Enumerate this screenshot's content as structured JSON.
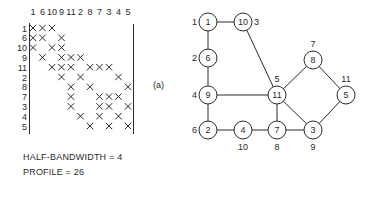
{
  "matrix": {
    "order": [
      "1",
      "6",
      "10",
      "9",
      "11",
      "2",
      "8",
      "7",
      "3",
      "4",
      "5"
    ],
    "rows": [
      {
        "label": "1",
        "cols": [
          0,
          1,
          2
        ]
      },
      {
        "label": "6",
        "cols": [
          0,
          1,
          3
        ]
      },
      {
        "label": "10",
        "cols": [
          0,
          2,
          3
        ]
      },
      {
        "label": "9",
        "cols": [
          1,
          3,
          4,
          5
        ]
      },
      {
        "label": "11",
        "cols": [
          2,
          3,
          4,
          6,
          7,
          8
        ]
      },
      {
        "label": "2",
        "cols": [
          3,
          5,
          9
        ]
      },
      {
        "label": "8",
        "cols": [
          4,
          6,
          10
        ]
      },
      {
        "label": "7",
        "cols": [
          4,
          7,
          8,
          9
        ]
      },
      {
        "label": "3",
        "cols": [
          4,
          7,
          8,
          10
        ]
      },
      {
        "label": "4",
        "cols": [
          5,
          7,
          9
        ]
      },
      {
        "label": "5",
        "cols": [
          6,
          8,
          10
        ]
      }
    ],
    "mark": "X"
  },
  "stats": {
    "half_bandwidth": "HALF-BANDWIDTH = 4",
    "profile": "PROFILE = 26"
  },
  "graph": {
    "panel_label": "(a)",
    "nodes": [
      {
        "id": "1",
        "x": 208,
        "y": 22,
        "order_label": "1",
        "label_pos": "left"
      },
      {
        "id": "10",
        "x": 243,
        "y": 22,
        "order_label": "3",
        "label_pos": "right"
      },
      {
        "id": "6",
        "x": 208,
        "y": 58,
        "order_label": "2",
        "label_pos": "left"
      },
      {
        "id": "9",
        "x": 208,
        "y": 95,
        "order_label": "4",
        "label_pos": "left"
      },
      {
        "id": "11",
        "x": 277,
        "y": 95,
        "order_label": "5",
        "label_pos": "top"
      },
      {
        "id": "8",
        "x": 313,
        "y": 60,
        "order_label": "7",
        "label_pos": "top"
      },
      {
        "id": "5",
        "x": 346,
        "y": 95,
        "order_label": "11",
        "label_pos": "top"
      },
      {
        "id": "2",
        "x": 208,
        "y": 130,
        "order_label": "6",
        "label_pos": "left"
      },
      {
        "id": "4",
        "x": 243,
        "y": 130,
        "order_label": "10",
        "label_pos": "bottom"
      },
      {
        "id": "7",
        "x": 277,
        "y": 130,
        "order_label": "8",
        "label_pos": "bottom"
      },
      {
        "id": "3",
        "x": 313,
        "y": 130,
        "order_label": "9",
        "label_pos": "bottom"
      }
    ],
    "edges": [
      [
        "1",
        "10"
      ],
      [
        "1",
        "6"
      ],
      [
        "6",
        "9"
      ],
      [
        "10",
        "11"
      ],
      [
        "9",
        "11"
      ],
      [
        "9",
        "2"
      ],
      [
        "11",
        "8"
      ],
      [
        "8",
        "5"
      ],
      [
        "11",
        "7"
      ],
      [
        "11",
        "3"
      ],
      [
        "5",
        "3"
      ],
      [
        "2",
        "4"
      ],
      [
        "4",
        "7"
      ],
      [
        "7",
        "3"
      ]
    ]
  }
}
